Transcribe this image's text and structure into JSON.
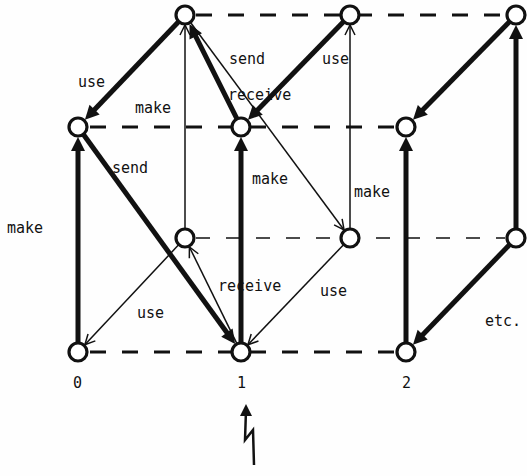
{
  "diagram": {
    "type": "state-transition lattice",
    "nodes": [
      {
        "id": "A",
        "row": 0,
        "col": 0
      },
      {
        "id": "B",
        "row": 0,
        "col": 1
      },
      {
        "id": "C",
        "row": 0,
        "col": 2
      },
      {
        "id": "D",
        "row": 1,
        "col": 0
      },
      {
        "id": "E",
        "row": 1,
        "col": 1
      },
      {
        "id": "F",
        "row": 1,
        "col": 2
      },
      {
        "id": "G",
        "row": 2,
        "col": 0
      },
      {
        "id": "H",
        "row": 2,
        "col": 1
      },
      {
        "id": "I",
        "row": 2,
        "col": 2
      },
      {
        "id": "J",
        "row": 3,
        "col": 0
      },
      {
        "id": "K",
        "row": 3,
        "col": 1
      },
      {
        "id": "L",
        "row": 3,
        "col": 2
      }
    ],
    "edges": [
      {
        "from": "J",
        "to": "D",
        "weight": "thick",
        "label": "make"
      },
      {
        "from": "A",
        "to": "D",
        "weight": "thick",
        "label": "use"
      },
      {
        "from": "D",
        "to": "K",
        "weight": "thick",
        "label": "send"
      },
      {
        "from": "G",
        "to": "A",
        "weight": "thin",
        "label": "make"
      },
      {
        "from": "E",
        "to": "A",
        "weight": "thick",
        "label": "receive"
      },
      {
        "from": "A",
        "to": "H",
        "weight": "thin",
        "label": "send"
      },
      {
        "from": "B",
        "to": "E",
        "weight": "thick",
        "label": "use"
      },
      {
        "from": "H",
        "to": "B",
        "weight": "thin",
        "label": "make"
      },
      {
        "from": "K",
        "to": "E",
        "weight": "thick",
        "label": "make"
      },
      {
        "from": "G",
        "to": "J",
        "weight": "thin",
        "label": "use"
      },
      {
        "from": "K",
        "to": "G",
        "weight": "thin",
        "label": "receive"
      },
      {
        "from": "H",
        "to": "K",
        "weight": "thin",
        "label": "use"
      },
      {
        "from": "L",
        "to": "F",
        "weight": "thick",
        "label": ""
      },
      {
        "from": "C",
        "to": "F",
        "weight": "thick",
        "label": ""
      },
      {
        "from": "I",
        "to": "C",
        "weight": "thick",
        "label": ""
      },
      {
        "from": "I",
        "to": "L",
        "weight": "thick",
        "label": ""
      }
    ],
    "labels": {
      "use_top_left": "use",
      "make_upper_mid": "make",
      "send_upper": "send",
      "use_upper_right": "use",
      "receive_upper": "receive",
      "send_mid_left": "send",
      "make_left": "make",
      "make_mid": "make",
      "make_right": "make",
      "receive_lower": "receive",
      "use_lower_left": "use",
      "use_lower_right": "use",
      "etc": "etc."
    },
    "column_indices": [
      "0",
      "1",
      "2"
    ],
    "event_marker": "lightning-arrow"
  }
}
